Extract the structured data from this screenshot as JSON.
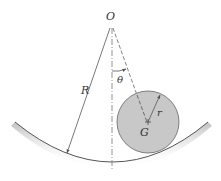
{
  "diagram": {
    "labels": {
      "origin": "O",
      "track_radius": "R",
      "angle": "θ",
      "disk_radius": "r",
      "center_of_mass": "G"
    },
    "colors": {
      "line": "#555555",
      "disk_fill": "#c8c8c8",
      "disk_stroke": "#666666",
      "track_shadow": "#bdbdbd",
      "background": "#ffffff"
    }
  }
}
